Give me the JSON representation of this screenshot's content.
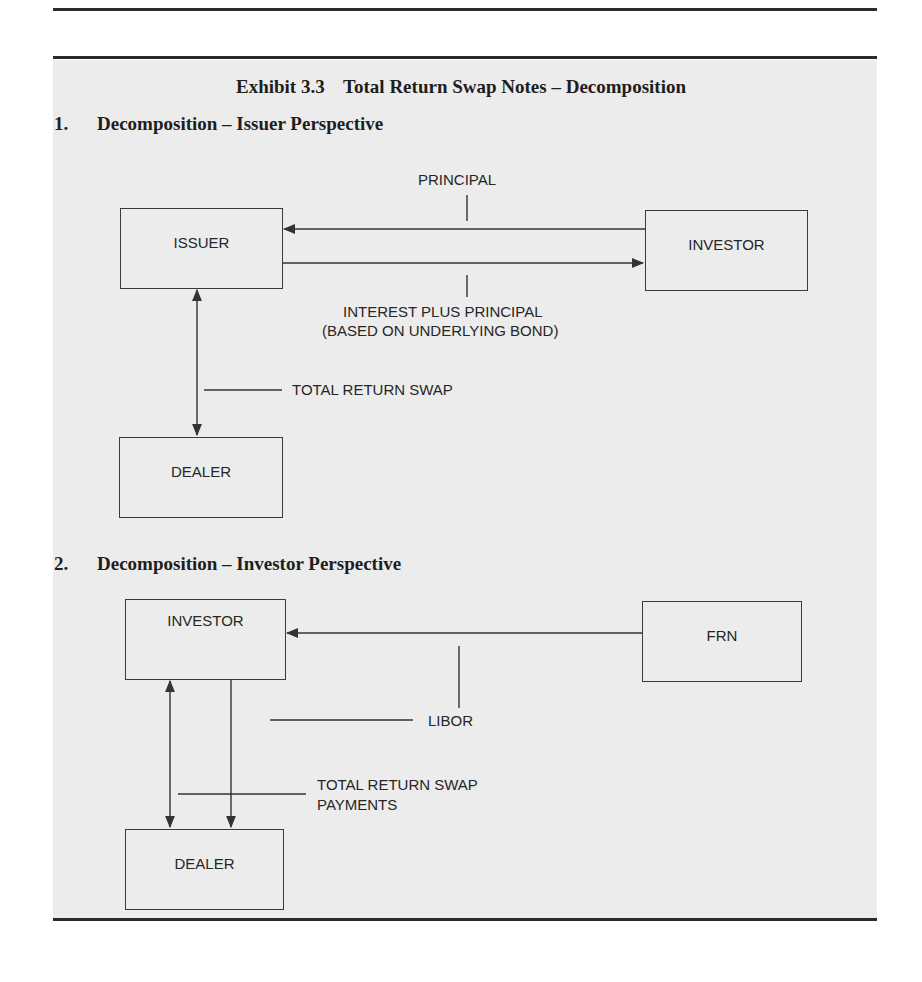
{
  "exhibit": {
    "number": "Exhibit 3.3",
    "title": "Total Return Swap Notes – Decomposition"
  },
  "sections": [
    {
      "number": "1.",
      "heading": "Decomposition – Issuer Perspective",
      "nodes": {
        "issuer": "ISSUER",
        "investor": "INVESTOR",
        "dealer": "DEALER"
      },
      "labels": {
        "principal": "PRINCIPAL",
        "interest_line1": "INTEREST PLUS PRINCIPAL",
        "interest_line2": "(BASED ON UNDERLYING BOND)",
        "trs": "TOTAL RETURN SWAP"
      },
      "flows": [
        {
          "from": "INVESTOR",
          "to": "ISSUER",
          "label": "PRINCIPAL"
        },
        {
          "from": "ISSUER",
          "to": "INVESTOR",
          "label": "INTEREST PLUS PRINCIPAL (BASED ON UNDERLYING BOND)"
        },
        {
          "from": "ISSUER",
          "to": "DEALER",
          "label": "TOTAL RETURN SWAP",
          "bidirectional": true
        }
      ]
    },
    {
      "number": "2.",
      "heading": "Decomposition – Investor Perspective",
      "nodes": {
        "investor": "INVESTOR",
        "frn": "FRN",
        "dealer": "DEALER"
      },
      "labels": {
        "libor": "LIBOR",
        "trs_line1": "TOTAL RETURN SWAP",
        "trs_line2": "PAYMENTS"
      },
      "flows": [
        {
          "from": "FRN",
          "to": "INVESTOR",
          "label": "LIBOR"
        },
        {
          "from": "INVESTOR",
          "to": "DEALER",
          "label": "LIBOR"
        },
        {
          "from": "DEALER",
          "to": "INVESTOR",
          "label": "TOTAL RETURN SWAP PAYMENTS",
          "bidirectional": true
        }
      ]
    }
  ],
  "colors": {
    "panel_bg": "#ececec",
    "line": "#333333",
    "text": "#262626"
  }
}
